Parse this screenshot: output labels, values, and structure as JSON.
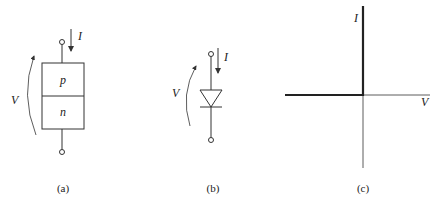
{
  "figure": {
    "panels": [
      {
        "id": "a",
        "caption": "(a)",
        "description": "p-n junction block",
        "labels": {
          "current": "I",
          "voltage": "V",
          "top_region": "p",
          "bottom_region": "n"
        }
      },
      {
        "id": "b",
        "caption": "(b)",
        "description": "diode circuit symbol",
        "labels": {
          "current": "I",
          "voltage": "V"
        }
      },
      {
        "id": "c",
        "caption": "(c)",
        "description": "ideal diode I-V characteristic",
        "labels": {
          "y_axis": "I",
          "x_axis": "V"
        }
      }
    ]
  },
  "colors": {
    "line": "#333333",
    "background": "#ffffff"
  }
}
